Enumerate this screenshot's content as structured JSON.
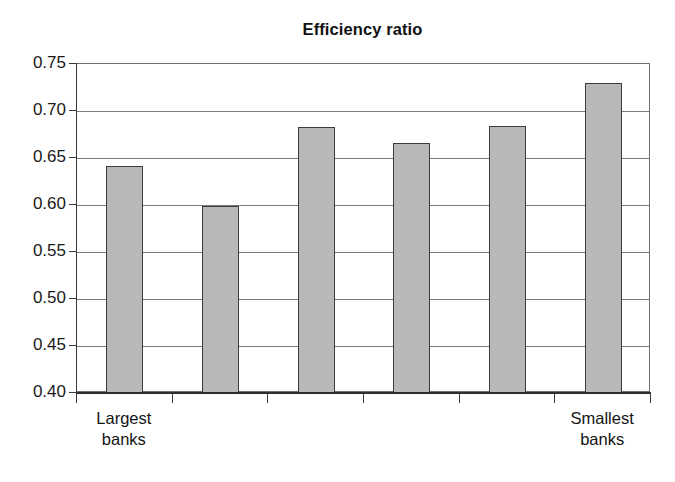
{
  "chart_data": {
    "type": "bar",
    "title": "Efficiency ratio",
    "xlabel": "",
    "ylabel": "",
    "categories": [
      "Largest banks",
      "",
      "",
      "",
      "",
      "Smallest banks"
    ],
    "category_labels": [
      {
        "line1": "Largest",
        "line2": "banks"
      },
      {
        "line1": "",
        "line2": ""
      },
      {
        "line1": "",
        "line2": ""
      },
      {
        "line1": "",
        "line2": ""
      },
      {
        "line1": "",
        "line2": ""
      },
      {
        "line1": "Smallest",
        "line2": "banks"
      }
    ],
    "values": [
      0.642,
      0.599,
      0.683,
      0.666,
      0.684,
      0.73
    ],
    "ylim": [
      0.4,
      0.75
    ],
    "ytick_labels": [
      "0.75",
      "0.70",
      "0.65",
      "0.60",
      "0.55",
      "0.50",
      "0.45",
      "0.40"
    ],
    "ytick_values": [
      0.75,
      0.7,
      0.65,
      0.6,
      0.55,
      0.5,
      0.45,
      0.4
    ],
    "grid": true,
    "legend": "none",
    "bar_color": "#b8b8b8",
    "bar_border_color": "#3b3b3b",
    "axis_color": "#3a3a3a",
    "background_color": "#ffffff"
  }
}
